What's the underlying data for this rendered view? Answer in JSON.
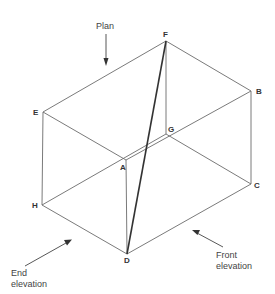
{
  "diagram": {
    "type": "isometric-box",
    "vertices": {
      "A": {
        "label": "A",
        "x": 126,
        "y": 160
      },
      "B": {
        "label": "B",
        "x": 251,
        "y": 91
      },
      "C": {
        "label": "C",
        "x": 251,
        "y": 184
      },
      "D": {
        "label": "D",
        "x": 127,
        "y": 254
      },
      "E": {
        "label": "E",
        "x": 43,
        "y": 112
      },
      "F": {
        "label": "F",
        "x": 166,
        "y": 41
      },
      "G": {
        "label": "G",
        "x": 166,
        "y": 134
      },
      "H": {
        "label": "H",
        "x": 42,
        "y": 205
      }
    },
    "edges": [
      [
        "E",
        "F"
      ],
      [
        "F",
        "B"
      ],
      [
        "B",
        "A"
      ],
      [
        "A",
        "E"
      ],
      [
        "H",
        "G"
      ],
      [
        "G",
        "C"
      ],
      [
        "C",
        "D"
      ],
      [
        "D",
        "H"
      ],
      [
        "E",
        "H"
      ],
      [
        "F",
        "G"
      ],
      [
        "B",
        "C"
      ],
      [
        "A",
        "D"
      ]
    ],
    "diagonal": [
      "F",
      "D"
    ],
    "views": {
      "plan": {
        "label": "Plan"
      },
      "end": {
        "line1": "End",
        "line2": "elevation"
      },
      "front": {
        "line1": "Front",
        "line2": "elevation"
      }
    },
    "colors": {
      "edge": "#6b6b6b",
      "diagonal": "#333333",
      "text": "#333333",
      "background": "#ffffff"
    }
  }
}
